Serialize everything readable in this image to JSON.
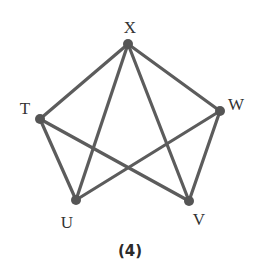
{
  "diagram": {
    "caption": "(4)",
    "colors": {
      "edge": "#5c5c5c",
      "node": "#555555",
      "label": "#333333"
    },
    "nodes": [
      {
        "id": "X",
        "label": "X",
        "x": 128,
        "y": 44,
        "lx": 130,
        "ly": 33
      },
      {
        "id": "T",
        "label": "T",
        "x": 40,
        "y": 119,
        "lx": 25,
        "ly": 114
      },
      {
        "id": "W",
        "label": "W",
        "x": 220,
        "y": 111,
        "lx": 236,
        "ly": 110
      },
      {
        "id": "U",
        "label": "U",
        "x": 76,
        "y": 200,
        "lx": 67,
        "ly": 228
      },
      {
        "id": "V",
        "label": "V",
        "x": 189,
        "y": 201,
        "lx": 199,
        "ly": 225
      }
    ],
    "edges": [
      [
        "X",
        "T"
      ],
      [
        "X",
        "W"
      ],
      [
        "X",
        "U"
      ],
      [
        "X",
        "V"
      ],
      [
        "T",
        "U"
      ],
      [
        "T",
        "V"
      ],
      [
        "W",
        "U"
      ],
      [
        "W",
        "V"
      ]
    ]
  }
}
